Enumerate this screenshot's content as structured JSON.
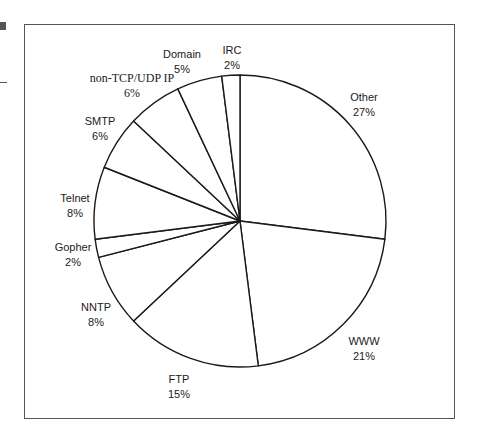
{
  "chart_data": {
    "type": "pie",
    "title": "",
    "start_angle_deg": 0,
    "direction": "clockwise",
    "slices": [
      {
        "label": "Other",
        "value": 27,
        "display": "27%"
      },
      {
        "label": "WWW",
        "value": 21,
        "display": "21%"
      },
      {
        "label": "FTP",
        "value": 15,
        "display": "15%"
      },
      {
        "label": "NNTP",
        "value": 8,
        "display": "8%"
      },
      {
        "label": "Gopher",
        "value": 2,
        "display": "2%"
      },
      {
        "label": "Telnet",
        "value": 8,
        "display": "8%"
      },
      {
        "label": "SMTP",
        "value": 6,
        "display": "6%"
      },
      {
        "label": "non-TCP/UDP IP",
        "value": 6,
        "display": "6%"
      },
      {
        "label": "Domain",
        "value": 5,
        "display": "5%"
      },
      {
        "label": "IRC",
        "value": 2,
        "display": "2%"
      }
    ],
    "legend": "none (labels placed around pie)",
    "fill": "#ffffff",
    "stroke": "#1a1a1a"
  },
  "labels": [
    {
      "name": "Other",
      "pct": "27%",
      "x": 364,
      "y": 90
    },
    {
      "name": "WWW",
      "pct": "21%",
      "x": 364,
      "y": 334
    },
    {
      "name": "FTP",
      "pct": "15%",
      "x": 179,
      "y": 372
    },
    {
      "name": "NNTP",
      "pct": "8%",
      "x": 96,
      "y": 300
    },
    {
      "name": "Gopher",
      "pct": "2%",
      "x": 73,
      "y": 240
    },
    {
      "name": "Telnet",
      "pct": "8%",
      "x": 75,
      "y": 191
    },
    {
      "name": "SMTP",
      "pct": "6%",
      "x": 100,
      "y": 114
    },
    {
      "name": "non-TCP/UDP IP",
      "pct": "6%",
      "x": 132,
      "y": 71,
      "serif": true
    },
    {
      "name": "Domain",
      "pct": "5%",
      "x": 182,
      "y": 47
    },
    {
      "name": "IRC",
      "pct": "2%",
      "x": 232,
      "y": 43
    }
  ],
  "geometry": {
    "cx": 240,
    "cy": 221,
    "r": 146
  }
}
